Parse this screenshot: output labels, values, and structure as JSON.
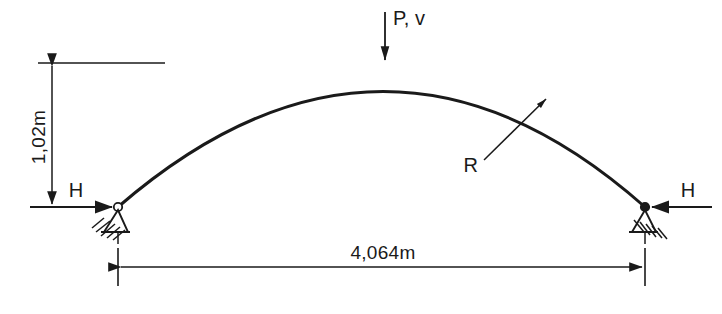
{
  "diagram": {
    "type": "structural-arch-schematic",
    "background_color": "#ffffff",
    "line_color": "#1a1a1a",
    "geometry": {
      "span_px": 527,
      "rise_px": 144,
      "left_support_px": [
        118,
        207
      ],
      "right_support_px": [
        645,
        207
      ],
      "apex_px": [
        385,
        63
      ]
    },
    "dimensions": {
      "rise": {
        "label": "1,02m",
        "orientation": "vertical",
        "value": 1.02,
        "unit": "m"
      },
      "span": {
        "label": "4,064m",
        "orientation": "horizontal",
        "value": 4.064,
        "unit": "m"
      }
    },
    "loads": {
      "vertical_load": {
        "label": "P, v",
        "direction": "down",
        "applied_at": "apex"
      },
      "left_thrust": {
        "label": "H",
        "direction": "right",
        "applied_at": "left-support"
      },
      "right_thrust": {
        "label": "H",
        "direction": "left",
        "applied_at": "right-support"
      }
    },
    "annotations": {
      "radius": {
        "label": "R",
        "leader_from_px": [
          486,
          157
        ],
        "leader_to_px": [
          546,
          99
        ]
      }
    },
    "supports": {
      "left": {
        "kind": "pinned-hinge",
        "hatched": true
      },
      "right": {
        "kind": "pinned-hinge",
        "hatched": true
      }
    }
  }
}
